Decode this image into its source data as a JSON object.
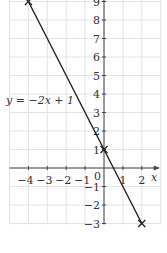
{
  "chart_data": {
    "type": "line",
    "title": "",
    "xlabel": "x",
    "ylabel": "",
    "xlim": [
      -5,
      3
    ],
    "ylim": [
      -4,
      9
    ],
    "grid": true,
    "x_ticks": [
      -4,
      -3,
      -2,
      -1,
      1,
      2
    ],
    "x_tick_labels": [
      "−4",
      "−3",
      "−2",
      "−1",
      "1",
      "2"
    ],
    "y_ticks": [
      9,
      8,
      7,
      6,
      5,
      4,
      3,
      2,
      1,
      -1,
      -2,
      -3
    ],
    "y_tick_labels": [
      "9",
      "8",
      "7",
      "6",
      "5",
      "4",
      "3",
      "2",
      "1",
      "−1",
      "−2",
      "−3"
    ],
    "origin_label": "0",
    "series": [
      {
        "name": "y = −2x + 1",
        "equation": "y = −2x + 1",
        "x": [
          -4,
          0,
          2
        ],
        "y": [
          9,
          1,
          -3
        ],
        "marker": "x",
        "color": "#222222"
      }
    ],
    "annotations": [
      {
        "text": "y = −2x + 1",
        "position": "left of line near y=3.5"
      }
    ]
  },
  "colors": {
    "grid": "#e4e4e4",
    "axis": "#444444",
    "line": "#222222"
  }
}
